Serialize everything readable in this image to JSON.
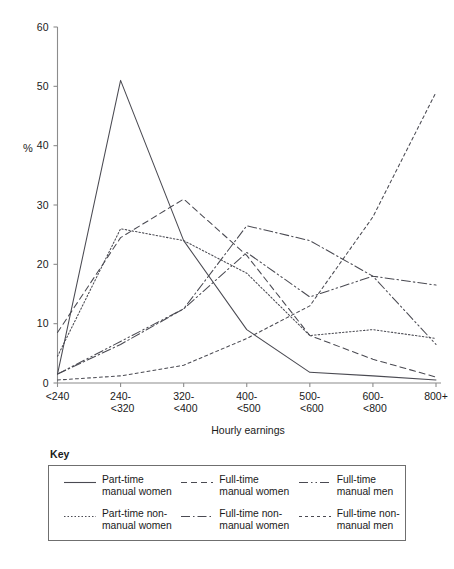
{
  "chart_data": {
    "type": "line",
    "title": "",
    "xlabel": "Hourly earnings",
    "ylabel": "%",
    "ylim": [
      0,
      60
    ],
    "yticks": [
      0,
      10,
      20,
      30,
      40,
      50,
      60
    ],
    "grid": false,
    "legend_position": "below-plot",
    "legend_title": "Key",
    "categories": [
      "<240",
      "240-\n<320",
      "320-\n<400",
      "400-\n<500",
      "500-\n<600",
      "600-\n<800",
      "800+"
    ],
    "category_values": [
      "<240",
      "240-<320",
      "320-<400",
      "400-<500",
      "500-<600",
      "600-<800",
      "800+"
    ],
    "series": [
      {
        "name": "Part-time\nmanual women",
        "label_line1": "Part-time",
        "label_line2": "manual women",
        "style": "solid",
        "dasharray": "none",
        "values": [
          1.5,
          51,
          24,
          9,
          1.8,
          1.2,
          0.5
        ]
      },
      {
        "name": "Full-time\nmanual women",
        "label_line1": "Full-time",
        "label_line2": "manual women",
        "style": "dashed",
        "dasharray": "6,4",
        "values": [
          8.5,
          24.5,
          31,
          21.5,
          8,
          4,
          1
        ]
      },
      {
        "name": "Full-time\nmanual men",
        "label_line1": "Full-time",
        "label_line2": "manual men",
        "style": "dash-dot-dot",
        "dasharray": "9,3,1.5,3,1.5,3",
        "values": [
          1.5,
          7,
          12.5,
          22,
          14.5,
          18,
          6.5
        ]
      },
      {
        "name": "Part-time non-\nmanual women",
        "label_line1": "Part-time non-",
        "label_line2": "manual women",
        "style": "dotted",
        "dasharray": "1.5,2",
        "values": [
          4.5,
          26,
          24,
          18.5,
          8,
          9,
          7.5
        ]
      },
      {
        "name": "Full-time non-\nmanual women",
        "label_line1": "Full-time non-",
        "label_line2": "manual women",
        "style": "dash-dot",
        "dasharray": "9,3,1.5,3",
        "values": [
          1.5,
          6.5,
          12.5,
          26.5,
          24,
          18,
          16.5
        ]
      },
      {
        "name": "Full-time non-\nmanual men",
        "label_line1": "Full-time non-",
        "label_line2": "manual men",
        "style": "fine-dashed",
        "dasharray": "3,3",
        "values": [
          0.5,
          1.2,
          3,
          7.5,
          13,
          28,
          49
        ]
      }
    ],
    "line_color": "#4a4a52"
  },
  "axis": {
    "y_tick_labels": [
      "0",
      "10",
      "20",
      "30",
      "40",
      "50",
      "60"
    ],
    "y_axis_caption": "%",
    "x_axis_caption": "Hourly earnings",
    "x_tick_labels_line1": [
      "<240",
      "240-",
      "320-",
      "400-",
      "500-",
      "600-",
      "800+"
    ],
    "x_tick_labels_line2": [
      "",
      "<320",
      "<400",
      "<500",
      "<600",
      "<800",
      ""
    ]
  },
  "legend": {
    "title": "Key",
    "items": [
      {
        "line1": "Part-time",
        "line2": "manual women",
        "dash": "none"
      },
      {
        "line1": "Full-time",
        "line2": "manual women",
        "dash": "6,4"
      },
      {
        "line1": "Full-time",
        "line2": "manual men",
        "dash": "9,3,1.5,3,1.5,3"
      },
      {
        "line1": "Part-time non-",
        "line2": "manual women",
        "dash": "1.5,2"
      },
      {
        "line1": "Full-time non-",
        "line2": "manual women",
        "dash": "9,3,1.5,3"
      },
      {
        "line1": "Full-time non-",
        "line2": "manual men",
        "dash": "3,3"
      }
    ]
  }
}
